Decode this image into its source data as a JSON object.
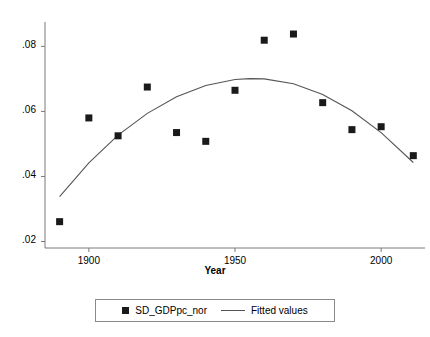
{
  "chart_data": {
    "type": "scatter",
    "title": "",
    "subtitle": "",
    "xlabel": "Year",
    "ylabel": "",
    "xlim": [
      1885,
      2015
    ],
    "ylim": [
      0.018,
      0.0875
    ],
    "grid": false,
    "legend_position": "bottom",
    "xticks": [
      1900,
      1950,
      2000
    ],
    "xticklabels": [
      "1900",
      "1950",
      "2000"
    ],
    "yticks": [
      0.02,
      0.04,
      0.06,
      0.08
    ],
    "yticklabels": [
      ".02",
      ".04",
      ".06",
      ".08"
    ],
    "series": [
      {
        "name": "SD_GDPpc_nor",
        "type": "scatter",
        "marker": "square",
        "color": "#1a1a1a",
        "x": [
          1890,
          1900,
          1910,
          1920,
          1930,
          1940,
          1950,
          1960,
          1970,
          1980,
          1990,
          2000,
          2011
        ],
        "values": [
          0.0261,
          0.058,
          0.0525,
          0.0675,
          0.0535,
          0.0508,
          0.0665,
          0.0819,
          0.0838,
          0.0627,
          0.0544,
          0.0553,
          0.0464
        ]
      },
      {
        "name": "Fitted values",
        "type": "line",
        "color": "#555555",
        "x": [
          1890,
          1900,
          1910,
          1920,
          1930,
          1940,
          1950,
          1955,
          1960,
          1970,
          1980,
          1990,
          2000,
          2011
        ],
        "values": [
          0.0338,
          0.0442,
          0.0527,
          0.0594,
          0.0645,
          0.068,
          0.0698,
          0.0701,
          0.07,
          0.0685,
          0.0652,
          0.0602,
          0.0535,
          0.0443
        ]
      }
    ]
  },
  "legend": {
    "entries": [
      {
        "label": "SD_GDPpc_nor",
        "glyph": "square-marker-icon"
      },
      {
        "label": "Fitted values",
        "glyph": "line-swatch-icon"
      }
    ]
  },
  "axes": {
    "x_title": "Year"
  }
}
